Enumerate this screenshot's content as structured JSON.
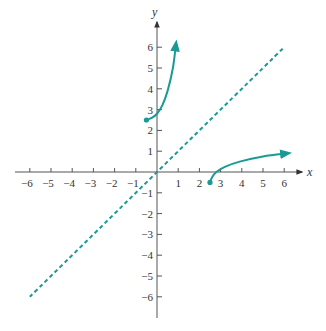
{
  "chart_data": {
    "type": "line",
    "title": "",
    "xlabel": "x",
    "ylabel": "y",
    "xlim": [
      -6,
      6
    ],
    "ylim": [
      -6,
      6
    ],
    "x_ticks": [
      -6,
      -5,
      -4,
      -3,
      -2,
      -1,
      1,
      2,
      3,
      4,
      5,
      6
    ],
    "y_ticks": [
      -6,
      -5,
      -4,
      -3,
      -2,
      -1,
      1,
      2,
      3,
      4,
      5,
      6
    ],
    "grid": false,
    "series": [
      {
        "name": "f(x)",
        "style": "solid",
        "color": "#1a9a95",
        "start_point": [
          -0.5,
          2.5
        ],
        "start_marker": "filled-dot",
        "end_arrow": true,
        "points": [
          [
            -0.5,
            2.5
          ],
          [
            -0.25,
            2.6
          ],
          [
            0,
            2.8
          ],
          [
            0.25,
            3.2
          ],
          [
            0.5,
            3.9
          ],
          [
            0.75,
            5.0
          ],
          [
            0.9,
            6.2
          ]
        ]
      },
      {
        "name": "f^-1(x)",
        "style": "solid",
        "color": "#1a9a95",
        "start_point": [
          2.5,
          -0.5
        ],
        "start_marker": "filled-dot",
        "end_arrow": true,
        "points": [
          [
            2.5,
            -0.5
          ],
          [
            2.6,
            -0.25
          ],
          [
            2.8,
            0
          ],
          [
            3.2,
            0.25
          ],
          [
            3.9,
            0.5
          ],
          [
            5.0,
            0.75
          ],
          [
            6.2,
            0.9
          ]
        ]
      },
      {
        "name": "y = x",
        "style": "dashed",
        "color": "#1a9a95",
        "points": [
          [
            -6,
            -6
          ],
          [
            6,
            6
          ]
        ]
      }
    ]
  },
  "axes": {
    "x_label": "x",
    "y_label": "y",
    "x_tick_labels": [
      "−6",
      "−5",
      "−4",
      "−3",
      "−2",
      "−1",
      "1",
      "2",
      "3",
      "4",
      "5",
      "6"
    ],
    "y_tick_labels": [
      "6",
      "5",
      "4",
      "3",
      "2",
      "1",
      "−1",
      "−2",
      "−3",
      "−4",
      "−5",
      "−6"
    ]
  },
  "colors": {
    "curve": "#1a9a95",
    "axis": "#555555"
  }
}
